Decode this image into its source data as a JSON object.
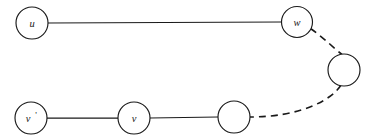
{
  "figure": {
    "background_color": "#ffffff",
    "stroke_color": "#1a1a1a",
    "width": 376,
    "height": 139
  },
  "nodes": [
    {
      "id": "u",
      "label": "u",
      "prime": "",
      "labeled": true,
      "cx": 32,
      "cy": 23,
      "r": 16
    },
    {
      "id": "w",
      "label": "w",
      "prime": "",
      "labeled": true,
      "cx": 297,
      "cy": 22,
      "r": 15.5
    },
    {
      "id": "x",
      "label": "",
      "prime": "",
      "labeled": false,
      "cx": 344,
      "cy": 70,
      "r": 16
    },
    {
      "id": "vp",
      "label": "v",
      "prime": "'",
      "labeled": true,
      "cx": 31,
      "cy": 118,
      "r": 16
    },
    {
      "id": "v",
      "label": "v",
      "prime": "",
      "labeled": true,
      "cx": 134,
      "cy": 118,
      "r": 16
    },
    {
      "id": "y",
      "label": "",
      "prime": "",
      "labeled": false,
      "cx": 234,
      "cy": 117,
      "r": 16
    }
  ],
  "edges": [
    {
      "id": "u-w",
      "from": "u",
      "to": "w",
      "style": "solid",
      "path": "M 48,23 L 281.5,22"
    },
    {
      "id": "w-x",
      "from": "w",
      "to": "x",
      "style": "dashed",
      "path": "M 310.5,28.5 C 324,38 336,50 342,54.5"
    },
    {
      "id": "x-y",
      "from": "x",
      "to": "y",
      "style": "dashed",
      "path": "M 341,85 C 332,100 300,117 250,117"
    },
    {
      "id": "vp-v",
      "from": "vp",
      "to": "v",
      "style": "solid",
      "path": "M 47,118 L 118,118"
    },
    {
      "id": "v-y",
      "from": "v",
      "to": "y",
      "style": "solid",
      "path": "M 150,118 L 218,117"
    }
  ],
  "legend": {
    "solid_meaning": "solid edge",
    "dashed_meaning": "dashed edge"
  }
}
